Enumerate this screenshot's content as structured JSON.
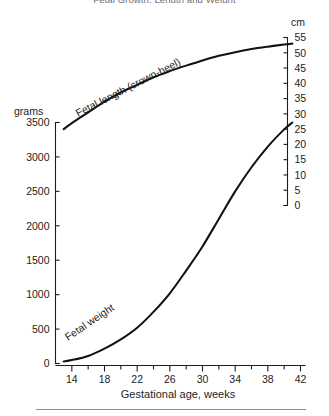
{
  "figure": {
    "clipped_title": "Fetal Growth: Length and Weight",
    "bottom_rule": true
  },
  "chart_data": {
    "type": "line",
    "title": "",
    "xlabel": "Gestational age, weeks",
    "x_ticks_major": [
      14,
      18,
      22,
      26,
      30,
      34,
      38,
      42
    ],
    "x_ticks_minor": [
      16,
      20,
      24,
      28,
      32,
      36,
      40
    ],
    "xlim": [
      12,
      42
    ],
    "left_axis": {
      "unit_label": "grams",
      "ticks": [
        0,
        500,
        1000,
        1500,
        2000,
        2500,
        3000,
        3500
      ],
      "ylim": [
        0,
        3500
      ]
    },
    "right_axis": {
      "unit_label": "cm",
      "ticks": [
        0,
        5,
        10,
        15,
        20,
        25,
        30,
        35,
        40,
        45,
        50,
        55
      ],
      "ylim": [
        0,
        55
      ]
    },
    "grid": false,
    "legend": "inline-curve-labels",
    "series": [
      {
        "name": "Fetal length (crown-heel)",
        "axis": "right",
        "unit": "cm",
        "x": [
          13,
          14,
          16,
          18,
          20,
          22,
          24,
          26,
          28,
          30,
          32,
          34,
          36,
          38,
          40,
          41
        ],
        "values": [
          25.0,
          27.0,
          30.5,
          34.0,
          37.0,
          39.5,
          42.0,
          44.0,
          45.8,
          47.5,
          49.0,
          50.2,
          51.2,
          52.0,
          52.7,
          53.0
        ]
      },
      {
        "name": "Fetal weight",
        "axis": "left",
        "unit": "grams",
        "x": [
          13,
          14,
          16,
          18,
          20,
          22,
          24,
          26,
          28,
          30,
          32,
          34,
          36,
          38,
          40,
          41
        ],
        "values": [
          30,
          50,
          110,
          215,
          350,
          520,
          750,
          1020,
          1350,
          1700,
          2100,
          2500,
          2850,
          3150,
          3400,
          3500
        ]
      }
    ]
  },
  "labels": {
    "length_curve": "Fetal length (crown-heel)",
    "weight_curve": "Fetal weight",
    "x_axis_title": "Gestational age, weeks",
    "left_unit": "grams",
    "right_unit": "cm"
  }
}
